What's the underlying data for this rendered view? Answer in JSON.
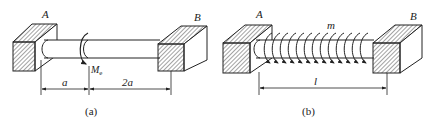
{
  "figure_a": {
    "label_left_support": "A",
    "label_right_support": "B",
    "moment_label": "M",
    "moment_subscript": "e",
    "dim_left": "a",
    "dim_right": "2a",
    "caption": "(a)"
  },
  "figure_b": {
    "label_left_support": "A",
    "label_right_support": "B",
    "distributed_moment_label": "m",
    "dim_total": "l",
    "caption": "(b)",
    "moment_arrow_count": 14
  },
  "colors": {
    "line": "#222222",
    "hatch": "#333333",
    "background": "#ffffff"
  }
}
